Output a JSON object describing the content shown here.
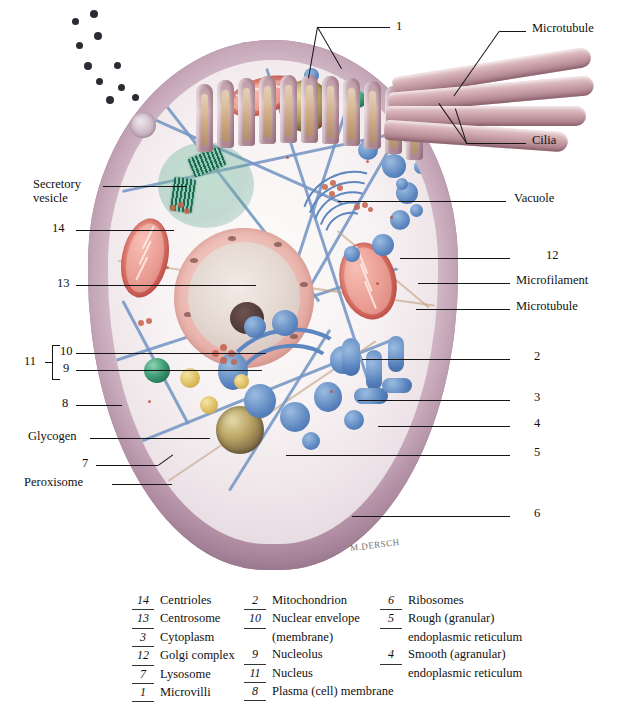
{
  "figure": {
    "artist_signature": "M.DERSCH"
  },
  "callouts": [
    {
      "id": "c1",
      "text": "1",
      "side": "top"
    },
    {
      "id": "c2",
      "text": "Microtubule",
      "side": "right"
    },
    {
      "id": "c3",
      "text": "Cilia",
      "side": "right"
    },
    {
      "id": "c4",
      "text": "Vacuole",
      "side": "right"
    },
    {
      "id": "c5",
      "text": "12",
      "side": "right"
    },
    {
      "id": "c6",
      "text": "Microfilament",
      "side": "right"
    },
    {
      "id": "c7",
      "text": "Microtubule",
      "side": "right"
    },
    {
      "id": "c8",
      "text": "2",
      "side": "right"
    },
    {
      "id": "c9",
      "text": "3",
      "side": "right"
    },
    {
      "id": "c10",
      "text": "4",
      "side": "right"
    },
    {
      "id": "c11",
      "text": "5",
      "side": "right"
    },
    {
      "id": "c12",
      "text": "6",
      "side": "right"
    },
    {
      "id": "c13",
      "text": "Secretory",
      "side": "left"
    },
    {
      "id": "c14",
      "text": "vesicle",
      "side": "left"
    },
    {
      "id": "c15",
      "text": "14",
      "side": "left"
    },
    {
      "id": "c16",
      "text": "13",
      "side": "left"
    },
    {
      "id": "c17",
      "text": "11",
      "side": "left"
    },
    {
      "id": "c18",
      "text": "10",
      "side": "left"
    },
    {
      "id": "c19",
      "text": "9",
      "side": "left"
    },
    {
      "id": "c20",
      "text": "8",
      "side": "left"
    },
    {
      "id": "c21",
      "text": "Glycogen",
      "side": "left"
    },
    {
      "id": "c22",
      "text": "7",
      "side": "left"
    },
    {
      "id": "c23",
      "text": "Peroxisome",
      "side": "left"
    }
  ],
  "legend": {
    "columns": [
      {
        "items": [
          {
            "num": "14",
            "name": "Centrioles",
            "cont": ""
          },
          {
            "num": "13",
            "name": "Centrosome",
            "cont": ""
          },
          {
            "num": "3",
            "name": "Cytoplasm",
            "cont": ""
          },
          {
            "num": "12",
            "name": "Golgi complex",
            "cont": ""
          },
          {
            "num": "7",
            "name": "Lysosome",
            "cont": ""
          },
          {
            "num": "1",
            "name": "Microvilli",
            "cont": ""
          }
        ]
      },
      {
        "items": [
          {
            "num": "2",
            "name": "Mitochondrion",
            "cont": ""
          },
          {
            "num": "10",
            "name": "Nuclear envelope",
            "cont": "(membrane)"
          },
          {
            "num": "9",
            "name": "Nucleolus",
            "cont": ""
          },
          {
            "num": "11",
            "name": "Nucleus",
            "cont": ""
          },
          {
            "num": "8",
            "name": "Plasma (cell) membrane",
            "cont": ""
          }
        ]
      },
      {
        "items": [
          {
            "num": "6",
            "name": "Ribosomes",
            "cont": ""
          },
          {
            "num": "5",
            "name": "Rough (granular)",
            "cont": "endoplasmic reticulum"
          },
          {
            "num": "4",
            "name": "Smooth (agranular)",
            "cont": "endoplasmic reticulum"
          }
        ]
      }
    ]
  },
  "colors": {
    "membrane": "#c3aab9",
    "cytosol": "#f7f2f3",
    "mitochondrion": "#d9685c",
    "nucleus": "#e2a89f",
    "nucleolus": "#4b3533",
    "golgi": "#5d87c0",
    "centriole": "#2a7a60",
    "lysosome": "#3f9e77",
    "peroxisome": "#ddbe63",
    "vacuole": "#8a7750",
    "microfilament": "#7596c4",
    "glycogen": "#c4614b",
    "leader_line": "#151515",
    "background": "#ffffff"
  }
}
